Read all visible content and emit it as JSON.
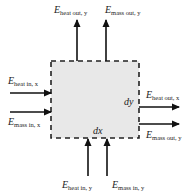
{
  "diagram": {
    "control_volume": {
      "fill": "#e8e8e8",
      "border_style": "dashed",
      "width_label": "dx",
      "height_label": "dy"
    },
    "flows": {
      "top": [
        {
          "symbol": "E",
          "subscript": "heat out, y",
          "direction": "out"
        },
        {
          "symbol": "E",
          "subscript": "mass out, y",
          "direction": "out"
        }
      ],
      "left": [
        {
          "symbol": "E",
          "subscript": "heat in, x",
          "direction": "in"
        },
        {
          "symbol": "E",
          "subscript": "mass in, x",
          "direction": "in"
        }
      ],
      "right": [
        {
          "symbol": "E",
          "subscript": "heat out, x",
          "direction": "out"
        },
        {
          "symbol": "E",
          "subscript": "mass out, y",
          "direction": "out"
        }
      ],
      "bottom": [
        {
          "symbol": "E",
          "subscript": "heat in, y",
          "direction": "in"
        },
        {
          "symbol": "E",
          "subscript": "mass in, y",
          "direction": "in"
        }
      ]
    }
  }
}
